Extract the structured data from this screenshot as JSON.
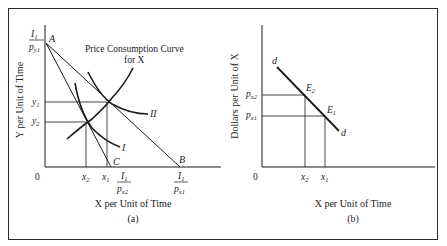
{
  "panel_a": {
    "caption": "(a)",
    "xlabel": "X per Unit of Time",
    "ylabel": "Y per Unit of Time",
    "origin": "0",
    "curve_label": "Price Consumption Curve",
    "curve_label_2": "for X",
    "points": {
      "A": "A",
      "B": "B",
      "C": "C"
    },
    "indifference_curves": [
      "I",
      "II"
    ],
    "y_ticks": {
      "intercept_num": "I",
      "intercept_num_sub": "1",
      "intercept_den": "p",
      "intercept_den_sub": "y1",
      "y1": "y",
      "y1_sub": "1",
      "y2": "y",
      "y2_sub": "2"
    },
    "x_ticks": {
      "x2": "x",
      "x2_sub": "2",
      "x1": "x",
      "x1_sub": "1",
      "C_num": "I",
      "C_num_sub": "1",
      "C_den": "p",
      "C_den_sub": "x2",
      "B_num": "I",
      "B_num_sub": "1",
      "B_den": "p",
      "B_den_sub": "x1"
    }
  },
  "panel_b": {
    "caption": "(b)",
    "xlabel": "X per Unit of Time",
    "ylabel": "Dollars per Unit of X",
    "origin": "0",
    "demand_label": "d",
    "points": {
      "E2": "E",
      "E2_sub": "2",
      "E1": "E",
      "E1_sub": "1"
    },
    "y_ticks": {
      "px2": "p",
      "px2_sub": "x2",
      "px1": "p",
      "px1_sub": "x1"
    },
    "x_ticks": {
      "x2": "x",
      "x2_sub": "2",
      "x1": "x",
      "x1_sub": "1"
    }
  },
  "colors": {
    "line": "#1a1a1a",
    "frame": "#2a2a2a",
    "background": "#ffffff"
  }
}
